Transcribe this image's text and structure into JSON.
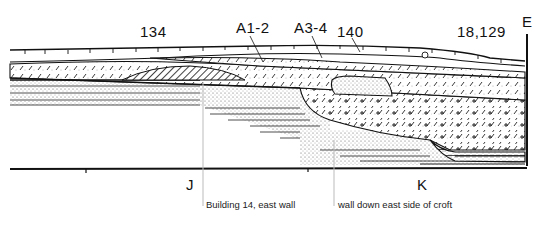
{
  "figure": {
    "type": "archaeological-section",
    "context_labels": [
      {
        "id": "ctx-134",
        "text": "134",
        "x": 140,
        "y": 37
      },
      {
        "id": "ctx-a1-2",
        "text": "A1-2",
        "x": 236,
        "y": 33
      },
      {
        "id": "ctx-a3-4",
        "text": "A3-4",
        "x": 294,
        "y": 33
      },
      {
        "id": "ctx-140",
        "text": "140",
        "x": 337,
        "y": 37
      },
      {
        "id": "ctx-18-129",
        "text": "18,129",
        "x": 457,
        "y": 37
      }
    ],
    "end_label": {
      "text": "E"
    },
    "grid_points": [
      {
        "text": "J",
        "x": 186,
        "y": 190
      },
      {
        "text": "K",
        "x": 417,
        "y": 190
      }
    ],
    "annotations": [
      {
        "text": "Building 14, east wall",
        "x": 206,
        "y": 208
      },
      {
        "text": "wall down east side of croft",
        "x": 338,
        "y": 208
      }
    ],
    "colors": {
      "ink": "#111111",
      "leader": "#bbbbbb",
      "background": "#ffffff"
    }
  }
}
